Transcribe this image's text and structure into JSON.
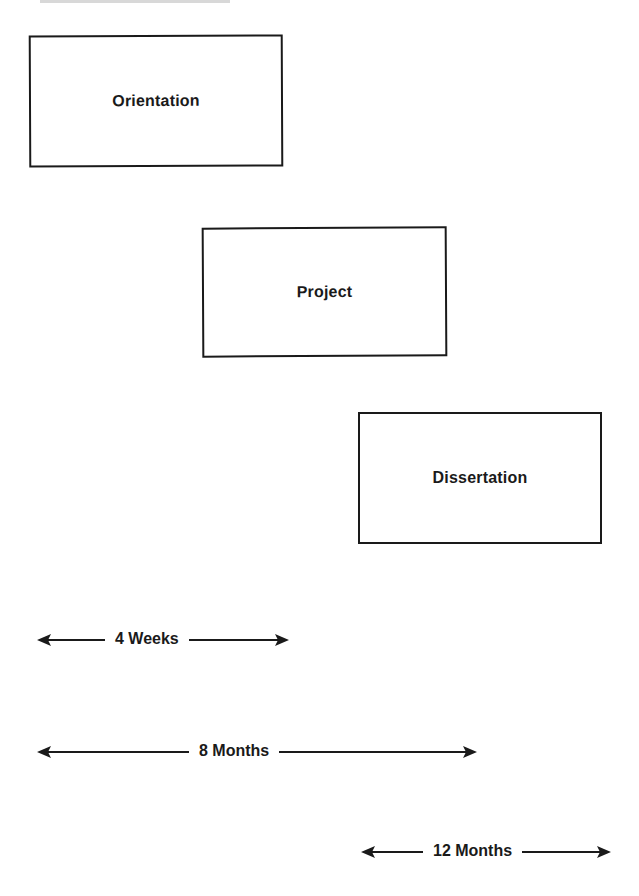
{
  "diagram": {
    "phases": [
      {
        "id": "orientation",
        "label": "Orientation"
      },
      {
        "id": "project",
        "label": "Project"
      },
      {
        "id": "dissertation",
        "label": "Dissertation"
      }
    ],
    "durations": [
      {
        "label": "4 Weeks",
        "applies_to": "Orientation"
      },
      {
        "label": "8 Months",
        "applies_to": "Orientation + Project"
      },
      {
        "label": "12 Months",
        "applies_to": "Dissertation"
      }
    ],
    "colors": {
      "ink": "#1a1a1a",
      "background": "#ffffff"
    }
  }
}
